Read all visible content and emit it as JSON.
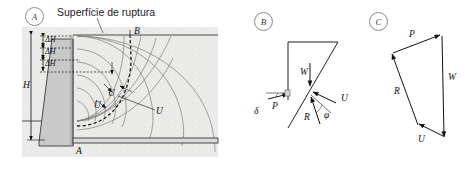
{
  "figure": {
    "panels": [
      {
        "id": "A",
        "letter": "A",
        "caption": "Superfície de ruptura",
        "labels": {
          "height": "H",
          "head_drop": "ΔH",
          "head_drop_count": 3,
          "crest_point": "B",
          "toe_point": "A",
          "uplift": "U"
        },
        "description": "Gravity retaining wall with flow net in backfill and curved failure surface from A to B"
      },
      {
        "id": "B",
        "letter": "B",
        "labels": {
          "weight": "W",
          "thrust": "P",
          "reaction": "R",
          "water_force": "U",
          "friction_angle": "φ",
          "wall_friction_angle": "δ"
        },
        "description": "Free body diagram of failure wedge with forces W, P, U, R"
      },
      {
        "id": "C",
        "letter": "C",
        "labels": {
          "thrust": "P",
          "weight": "W",
          "water_force": "U",
          "reaction": "R"
        },
        "description": "Closed force polygon P, W, U, R"
      }
    ]
  },
  "colors": {
    "soil_fill": "#ebebe9",
    "wall_fill": "#c9c9c9",
    "line": "#333333",
    "flownet": "#6e6e6e",
    "circle_stroke": "#8a8a8a"
  }
}
